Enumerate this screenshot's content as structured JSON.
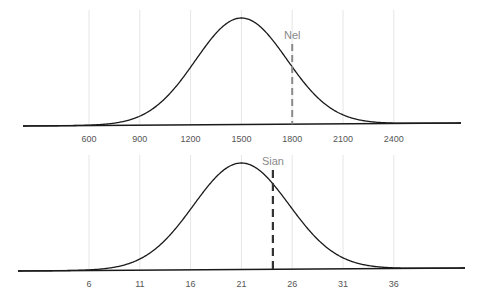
{
  "chart_data": [
    {
      "type": "line",
      "title": "",
      "xlabel": "",
      "ylabel": "",
      "description": "Normal distribution density curve with a dashed vertical marker",
      "distribution": {
        "mean": 1500,
        "sd": 270
      },
      "x_ticks": [
        600,
        900,
        1200,
        1500,
        1800,
        2100,
        2400
      ],
      "xlim": [
        265,
        2750
      ],
      "grid": "vertical",
      "marker": {
        "label": "Nel",
        "x": 1800,
        "color": "#8a8a8a",
        "style": "dashed"
      }
    },
    {
      "type": "line",
      "title": "",
      "xlabel": "",
      "ylabel": "",
      "description": "Normal distribution density curve with a dashed vertical marker",
      "distribution": {
        "mean": 21,
        "sd": 4.7
      },
      "x_ticks": [
        6,
        11,
        16,
        21,
        26,
        31,
        36
      ],
      "xlim": [
        0,
        45
      ],
      "grid": "vertical",
      "marker": {
        "label": "Sian",
        "x": 24.1,
        "color": "#333333",
        "style": "dashed"
      }
    }
  ],
  "labels": {
    "top_ticks": [
      "600",
      "900",
      "1200",
      "1500",
      "1800",
      "2100",
      "2400"
    ],
    "bottom_ticks": [
      "6",
      "11",
      "16",
      "21",
      "26",
      "31",
      "36"
    ],
    "top_marker": "Nel",
    "bottom_marker": "Sian"
  }
}
